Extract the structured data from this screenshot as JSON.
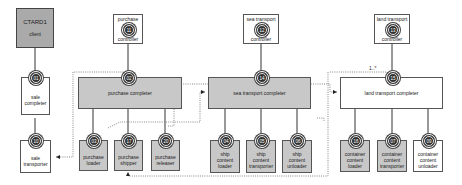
{
  "diagram": {
    "client": {
      "title": "CTARD1",
      "subtitle": "client"
    },
    "controllers": [
      {
        "id": "purchase-controller",
        "lines": [
          "purchase",
          "controller"
        ],
        "badge": "11"
      },
      {
        "id": "sea-transport-controller",
        "lines": [
          "sea transport",
          "controller"
        ],
        "badge": "12"
      },
      {
        "id": "land-transport-controller",
        "lines": [
          "land transport",
          "controller"
        ],
        "badge": "13"
      }
    ],
    "completers": [
      {
        "id": "sale-completer",
        "lines": [
          "sale",
          "completer"
        ],
        "badge": "01"
      },
      {
        "id": "purchase-completer",
        "label": "purchase completer",
        "badge": "02"
      },
      {
        "id": "sea-transport-completer",
        "label": "sea transport completer",
        "badge": "14"
      },
      {
        "id": "land-transport-completer",
        "label": "land transport completer",
        "badge": "15"
      }
    ],
    "workers": [
      {
        "id": "sale-transporter",
        "lines": [
          "sale",
          "transporter"
        ],
        "badge": "10"
      },
      {
        "id": "purchase-loader",
        "lines": [
          "purchase",
          "loader"
        ],
        "badge": "03"
      },
      {
        "id": "purchase-shipper",
        "lines": [
          "purchase",
          "shipper"
        ],
        "badge": "17"
      },
      {
        "id": "purchase-releaser",
        "lines": [
          "purchase",
          "releaser"
        ],
        "badge": "20"
      },
      {
        "id": "ship-content-loader",
        "lines": [
          "ship",
          "content",
          "loader"
        ],
        "badge": "04"
      },
      {
        "id": "ship-content-transporter",
        "lines": [
          "ship",
          "content",
          "transporter"
        ],
        "badge": "05"
      },
      {
        "id": "ship-content-unloader",
        "lines": [
          "ship",
          "content",
          "unloader"
        ],
        "badge": "06"
      },
      {
        "id": "container-content-loader",
        "lines": [
          "container",
          "content",
          "loader"
        ],
        "badge": "16"
      },
      {
        "id": "container-content-transporter",
        "lines": [
          "container",
          "content",
          "transporter"
        ],
        "badge": "07"
      },
      {
        "id": "container-content-unloader",
        "lines": [
          "container",
          "content",
          "unloader"
        ],
        "badge": "09"
      }
    ],
    "multiplicity": "1..*"
  }
}
